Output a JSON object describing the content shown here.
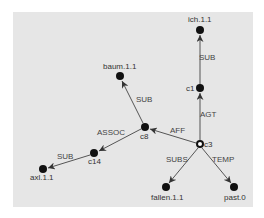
{
  "diagram": {
    "background": "#e6e6e6",
    "node_color": "#111111",
    "edge_color": "#555555",
    "nodes": [
      {
        "id": "ich.1.1",
        "label": "ich.1.1",
        "x": 200,
        "y": 30,
        "type": "filled"
      },
      {
        "id": "c1",
        "label": "c1",
        "x": 200,
        "y": 88,
        "type": "filled"
      },
      {
        "id": "baum.1.1",
        "label": "baum.1.1",
        "x": 120,
        "y": 76,
        "type": "filled"
      },
      {
        "id": "c8",
        "label": "c8",
        "x": 145,
        "y": 127,
        "type": "filled"
      },
      {
        "id": "c3",
        "label": "c3",
        "x": 200,
        "y": 144,
        "type": "hollow"
      },
      {
        "id": "c14",
        "label": "c14",
        "x": 94,
        "y": 153,
        "type": "filled"
      },
      {
        "id": "axl.1.1",
        "label": "axl.1.1",
        "x": 43,
        "y": 169,
        "type": "filled"
      },
      {
        "id": "fallen.1.1",
        "label": "fallen.1.1",
        "x": 166,
        "y": 187,
        "type": "filled"
      },
      {
        "id": "past.0",
        "label": "past.0",
        "x": 234,
        "y": 187,
        "type": "filled"
      }
    ],
    "edges": [
      {
        "from": "c1",
        "to": "ich.1.1",
        "label": "SUB"
      },
      {
        "from": "c3",
        "to": "c1",
        "label": "AGT"
      },
      {
        "from": "c3",
        "to": "c8",
        "label": "AFF"
      },
      {
        "from": "c8",
        "to": "baum.1.1",
        "label": "SUB"
      },
      {
        "from": "c8",
        "to": "c14",
        "label": "ASSOC"
      },
      {
        "from": "c14",
        "to": "axl.1.1",
        "label": "SUB"
      },
      {
        "from": "c3",
        "to": "fallen.1.1",
        "label": "SUBS"
      },
      {
        "from": "c3",
        "to": "past.0",
        "label": "TEMP"
      }
    ]
  }
}
